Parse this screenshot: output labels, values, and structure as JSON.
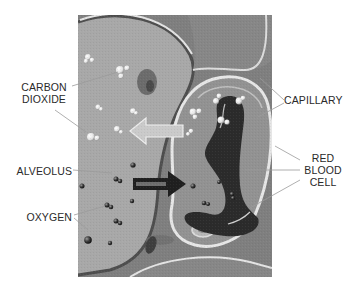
{
  "diagram": {
    "labels": {
      "carbon_dioxide": {
        "line1": "CARBON",
        "line2": "DIOXIDE"
      },
      "capillary": "CAPILLARY",
      "alveolus": "ALVEOLUS",
      "oxygen": "OXYGEN",
      "red_blood_cell": {
        "line1": "RED",
        "line2": "BLOOD",
        "line3": "CELL"
      }
    },
    "arrows": {
      "co2_direction": "capillary-to-alveolus (light arrow, pointing left)",
      "o2_direction": "alveolus-to-capillary (dark arrow, pointing right)"
    },
    "colors": {
      "alveolus_fill": "#a9a9a9",
      "capillary_fill": "#8e8e8e",
      "tissue_fill": "#7d7d7d",
      "membrane": "#e6e6e6",
      "rbc_fill": "#2b2b2b",
      "co2_arrow": "#c9c9c9",
      "o2_arrow": "#1e1e1e",
      "label_text": "#2a2a2a",
      "leader_line": "#9a9a9a"
    }
  }
}
